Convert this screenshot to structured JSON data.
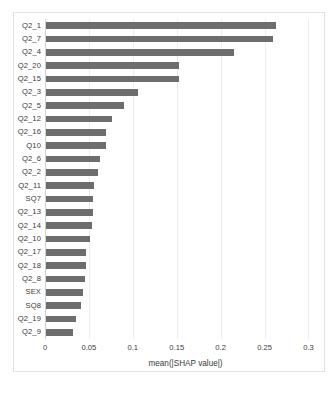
{
  "chart_data": {
    "type": "bar",
    "orientation": "horizontal",
    "title": "",
    "xlabel": "mean(|SHAP value|)",
    "ylabel": "",
    "xlim": [
      0,
      0.32
    ],
    "xticks": [
      0,
      0.05,
      0.1,
      0.15,
      0.2,
      0.25,
      0.3
    ],
    "xtick_labels": [
      "0",
      "0.05",
      "0.1",
      "0.15",
      "0.2",
      "0.25",
      "0.3"
    ],
    "grid": true,
    "legend": "none",
    "bar_color": "#6d6d6d",
    "categories": [
      "Q2_1",
      "Q2_7",
      "Q2_4",
      "Q2_20",
      "Q2_15",
      "Q2_3",
      "Q2_5",
      "Q2_12",
      "Q2_16",
      "Q10",
      "Q2_6",
      "Q2_2",
      "Q2_11",
      "SQ7",
      "Q2_13",
      "Q2_14",
      "Q2_10",
      "Q2_17",
      "Q2_18",
      "Q2_8",
      "SEX",
      "SQ8",
      "Q2_19",
      "Q2_9"
    ],
    "values": [
      0.262,
      0.259,
      0.214,
      0.152,
      0.152,
      0.105,
      0.089,
      0.075,
      0.068,
      0.068,
      0.061,
      0.059,
      0.055,
      0.054,
      0.053,
      0.052,
      0.05,
      0.046,
      0.046,
      0.044,
      0.042,
      0.04,
      0.034,
      0.031
    ]
  },
  "caption": {
    "text": ""
  }
}
